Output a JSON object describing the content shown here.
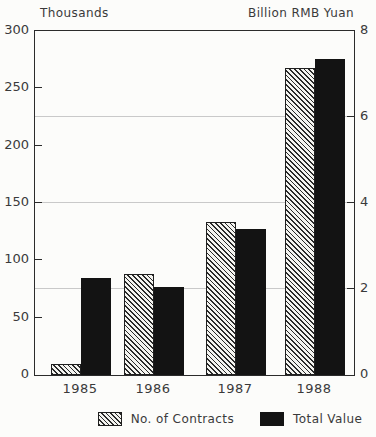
{
  "chart_data": {
    "type": "bar",
    "categories": [
      "1985",
      "1986",
      "1987",
      "1988"
    ],
    "series": [
      {
        "name": "No. of Contracts",
        "axis": "left",
        "style": "hatched",
        "values": [
          10,
          88,
          133,
          268
        ]
      },
      {
        "name": "Total Value",
        "axis": "right",
        "style": "solid",
        "values": [
          2.25,
          2.05,
          3.4,
          7.35
        ]
      }
    ],
    "left_axis": {
      "label": "Thousands",
      "min": 0,
      "max": 300,
      "ticks": [
        0,
        50,
        100,
        150,
        200,
        250,
        300
      ]
    },
    "right_axis": {
      "label": "Billion RMB Yuan",
      "min": 0,
      "max": 8,
      "ticks": [
        0,
        2,
        4,
        6,
        8
      ]
    },
    "gridlines_right_values": [
      2,
      4,
      6
    ],
    "legend_position": "bottom",
    "grid": true
  },
  "colors": {
    "bar_solid": "#131313",
    "hatch_line": "#2a2a2a",
    "axis": "#2b2b2b",
    "gridline": "#c9c9c9",
    "text": "#3a3a3a",
    "background": "#fcfcfa"
  }
}
